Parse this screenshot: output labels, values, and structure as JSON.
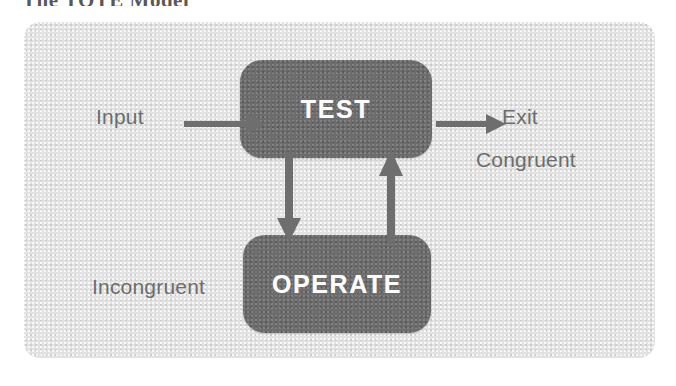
{
  "figure": {
    "caption": "The TOTE Model",
    "type": "flow-diagram"
  },
  "colors": {
    "panel_background": "#e2e2e2",
    "box_fill": "#6c6c6c",
    "box_text": "#fbfbfb",
    "label_text": "#6d6d6d",
    "arrow": "#6e6e6e",
    "page_background": "#ffffff"
  },
  "diagram": {
    "nodes": [
      {
        "id": "test",
        "label": "TEST"
      },
      {
        "id": "operate",
        "label": "OPERATE"
      }
    ],
    "labels": [
      {
        "id": "input",
        "text": "Input"
      },
      {
        "id": "exit",
        "text": "Exit"
      },
      {
        "id": "congruent",
        "text": "Congruent"
      },
      {
        "id": "incongruent",
        "text": "Incongruent"
      }
    ],
    "arrows": [
      {
        "id": "input-to-test",
        "direction": "right",
        "from": "Input",
        "to": "TEST"
      },
      {
        "id": "test-to-exit",
        "direction": "right",
        "from": "TEST",
        "to": "Exit"
      },
      {
        "id": "test-to-operate",
        "direction": "down",
        "from": "TEST",
        "to": "OPERATE"
      },
      {
        "id": "operate-to-test",
        "direction": "up",
        "from": "OPERATE",
        "to": "TEST"
      }
    ]
  }
}
